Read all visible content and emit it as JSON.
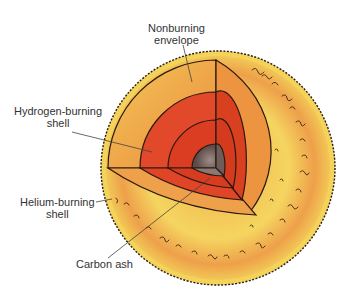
{
  "diagram": {
    "labels": {
      "nonburning_envelope": {
        "line1": "Nonburning",
        "line2": "envelope"
      },
      "hydrogen_shell": {
        "line1": "Hydrogen-burning",
        "line2": "shell"
      },
      "helium_shell": {
        "line1": "Helium-burning",
        "line2": "shell"
      },
      "carbon_ash": {
        "line1": "Carbon ash"
      }
    },
    "colors": {
      "envelope_outer": "#f2d35a",
      "envelope_inner": "#ee9a45",
      "hydrogen_shell": "#e2482a",
      "helium_shell": "#db3d22",
      "core": "#7d6a66",
      "outline": "#2a1a10"
    }
  }
}
